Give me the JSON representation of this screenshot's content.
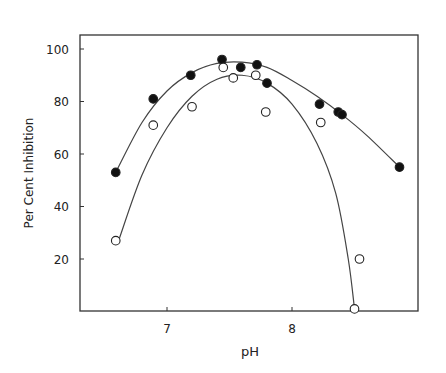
{
  "chart_data": {
    "type": "scatter",
    "title": "",
    "xlabel": "pH",
    "ylabel": "Per Cent Inhibition",
    "xlim": [
      6.6,
      8.94
    ],
    "ylim": [
      0,
      105
    ],
    "x_ticks": [
      7,
      8
    ],
    "y_ticks": [
      20,
      40,
      60,
      80,
      100
    ],
    "grid": false,
    "legend": null,
    "series": [
      {
        "name": "filled circles",
        "marker": "filled",
        "x": [
          6.59,
          6.89,
          7.19,
          7.44,
          7.59,
          7.72,
          7.8,
          8.22,
          8.37,
          8.4,
          8.86
        ],
        "y": [
          53,
          81,
          90,
          96,
          93,
          94,
          87,
          79,
          76,
          75,
          55
        ],
        "fit_curve": [
          [
            6.59,
            53
          ],
          [
            6.8,
            72
          ],
          [
            7.0,
            84
          ],
          [
            7.2,
            91
          ],
          [
            7.4,
            94.5
          ],
          [
            7.6,
            95
          ],
          [
            7.8,
            93
          ],
          [
            8.0,
            88
          ],
          [
            8.2,
            82
          ],
          [
            8.4,
            75
          ],
          [
            8.6,
            67
          ],
          [
            8.86,
            55
          ]
        ]
      },
      {
        "name": "open circles",
        "marker": "open",
        "x": [
          6.59,
          6.89,
          7.2,
          7.45,
          7.53,
          7.71,
          7.79,
          8.23,
          8.54,
          8.5
        ],
        "y": [
          27,
          71,
          78,
          93,
          89,
          90,
          76,
          72,
          20,
          1
        ],
        "fit_curve": [
          [
            6.62,
            28
          ],
          [
            6.8,
            52
          ],
          [
            7.0,
            70
          ],
          [
            7.2,
            82
          ],
          [
            7.4,
            88.5
          ],
          [
            7.6,
            90
          ],
          [
            7.8,
            87
          ],
          [
            8.0,
            79
          ],
          [
            8.2,
            64
          ],
          [
            8.35,
            45
          ],
          [
            8.45,
            20
          ],
          [
            8.5,
            1
          ]
        ]
      }
    ]
  }
}
